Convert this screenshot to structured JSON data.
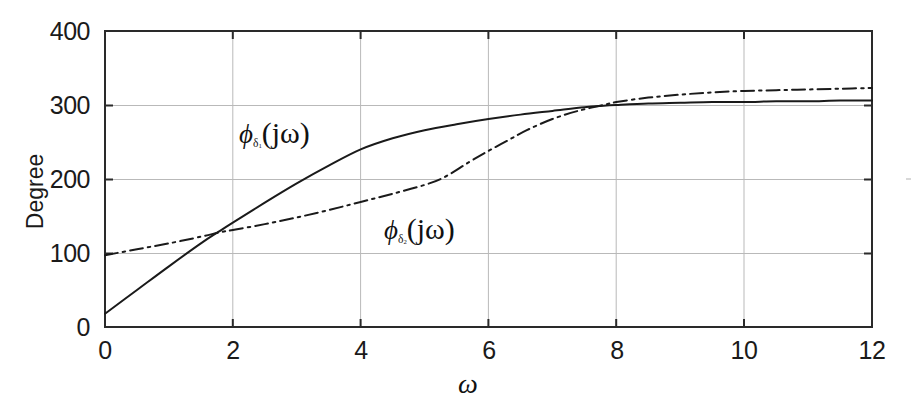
{
  "figure": {
    "background": "#ffffff",
    "ink_color": "#1a1a1a",
    "grid_color": "#b9b9b9"
  },
  "axes": {
    "x_label": "ω",
    "y_label": "Degree",
    "x_ticks": [
      "0",
      "2",
      "4",
      "6",
      "8",
      "10",
      "12"
    ],
    "y_ticks": [
      "0",
      "100",
      "200",
      "300",
      "400"
    ]
  },
  "series_labels": {
    "phi1": {
      "phi": "ϕ",
      "delta": "δ",
      "index": "1",
      "arg": "(jω)"
    },
    "phi2": {
      "phi": "ϕ",
      "delta": "δ",
      "index": "2",
      "arg": "(jω)"
    }
  },
  "chart_data": {
    "type": "line",
    "title": "",
    "xlabel": "ω",
    "ylabel": "Degree",
    "xlim": [
      0,
      12
    ],
    "ylim": [
      0,
      400
    ],
    "xticks": [
      0,
      2,
      4,
      6,
      8,
      10,
      12
    ],
    "yticks": [
      0,
      100,
      200,
      300,
      400
    ],
    "grid": true,
    "legend_position": "inline-annotation",
    "series": [
      {
        "name": "ϕ_δ1(jω)",
        "style": "solid",
        "color": "#1a1a1a",
        "x": [
          0,
          0.5,
          1,
          1.5,
          1.8,
          2,
          2.5,
          3,
          3.5,
          4,
          4.5,
          5,
          5.5,
          6,
          6.5,
          7,
          7.5,
          7.8,
          8,
          8.5,
          9,
          9.5,
          10,
          10.5,
          11,
          11.5,
          12
        ],
        "values": [
          18,
          50,
          82,
          113,
          130,
          141,
          168,
          194,
          218,
          240,
          255,
          266,
          274,
          281,
          287,
          292,
          297,
          299,
          300,
          302,
          303,
          304,
          304,
          305,
          305,
          306,
          306
        ]
      },
      {
        "name": "ϕ_δ2(jω)",
        "style": "dash-dot",
        "color": "#1a1a1a",
        "x": [
          0,
          0.5,
          1,
          1.5,
          1.8,
          2,
          2.5,
          3,
          3.5,
          4,
          4.5,
          5,
          5.3,
          5.7,
          6,
          6.3,
          6.6,
          7,
          7.4,
          7.8,
          8,
          8.5,
          9,
          9.5,
          10,
          10.5,
          11,
          11.5,
          12
        ],
        "values": [
          97,
          105,
          113,
          122,
          128,
          131,
          139,
          148,
          158,
          169,
          180,
          192,
          202,
          223,
          238,
          252,
          266,
          281,
          292,
          300,
          304,
          310,
          314,
          317,
          319,
          320,
          321,
          322,
          323
        ]
      }
    ],
    "annotations": [
      {
        "text": "ϕ_δ1(jω)",
        "x": 2.1,
        "y": 245
      },
      {
        "text": "ϕ_δ2(jω)",
        "x": 4.4,
        "y": 118
      }
    ],
    "intersections": [
      {
        "x": 1.8,
        "y": 130
      },
      {
        "x": 7.8,
        "y": 300
      }
    ]
  }
}
